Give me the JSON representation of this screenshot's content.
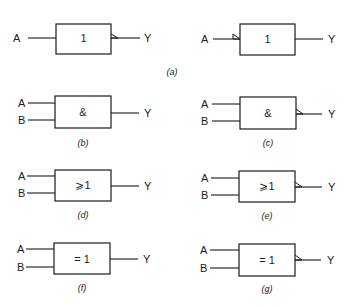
{
  "figure": {
    "gates": [
      {
        "id": "a1",
        "symbol": "1",
        "inputs": [
          "A"
        ],
        "output": "Y",
        "negation": "output",
        "caption": ""
      },
      {
        "id": "a2",
        "symbol": "1",
        "inputs": [
          "A"
        ],
        "output": "Y",
        "negation": "input",
        "caption": ""
      },
      {
        "id": "b",
        "symbol": "&",
        "inputs": [
          "A",
          "B"
        ],
        "output": "Y",
        "negation": "none",
        "caption": "(b)"
      },
      {
        "id": "c",
        "symbol": "&",
        "inputs": [
          "A",
          "B"
        ],
        "output": "Y",
        "negation": "output",
        "caption": "(c)"
      },
      {
        "id": "d",
        "symbol": "⩾1",
        "inputs": [
          "A",
          "B"
        ],
        "output": "Y",
        "negation": "none",
        "caption": "(d)"
      },
      {
        "id": "e",
        "symbol": "⩾1",
        "inputs": [
          "A",
          "B"
        ],
        "output": "Y",
        "negation": "output",
        "caption": "(e)"
      },
      {
        "id": "f",
        "symbol": "= 1",
        "inputs": [
          "A",
          "B"
        ],
        "output": "Y",
        "negation": "none",
        "caption": "(f)"
      },
      {
        "id": "g",
        "symbol": "= 1",
        "inputs": [
          "A",
          "B"
        ],
        "output": "Y",
        "negation": "output",
        "caption": "(g)"
      }
    ],
    "shared_caption_a": "(a)"
  },
  "colors": {
    "ink": "#1a1a1a",
    "background": "#ffffff"
  }
}
